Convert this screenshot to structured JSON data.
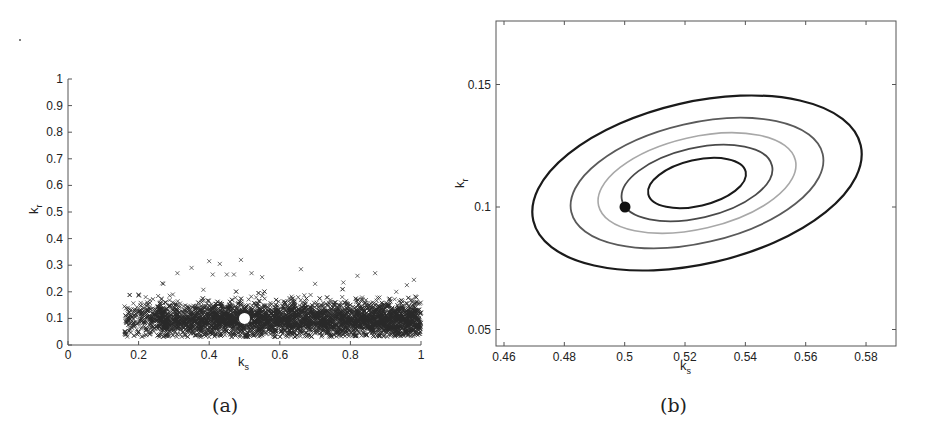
{
  "chart_data": [
    {
      "id": "a",
      "type": "scatter",
      "caption": "(a)",
      "xlabel": "k_s",
      "ylabel": "k_r",
      "xlim": [
        0,
        1
      ],
      "ylim": [
        0,
        1
      ],
      "xticks": [
        "0",
        "0.2",
        "0.4",
        "0.6",
        "0.8",
        "1"
      ],
      "yticks": [
        "0",
        "0.1",
        "0.2",
        "0.3",
        "0.4",
        "0.5",
        "0.6",
        "0.7",
        "0.8",
        "0.9",
        "1"
      ],
      "grid": false,
      "series": [
        {
          "name": "samples",
          "marker": "x",
          "color": "#222222",
          "description": "dense cloud of x-markers spanning k_s from ~0.16 to 1.0, k_r mostly 0.03-0.2, scattered outliers up to ~0.32",
          "x_range": [
            0.16,
            1.0
          ],
          "y_core_range": [
            0.04,
            0.18
          ],
          "y_max_outlier": 0.32
        },
        {
          "name": "true value",
          "marker": "filled-circle",
          "color": "#ffffff",
          "x": [
            0.5
          ],
          "y": [
            0.1
          ]
        }
      ]
    },
    {
      "id": "b",
      "type": "contour",
      "caption": "(b)",
      "xlabel": "k_s",
      "ylabel": "k_r",
      "xlim": [
        0.457,
        0.59
      ],
      "ylim": [
        0.043,
        0.176
      ],
      "xticks": [
        "0.46",
        "0.48",
        "0.5",
        "0.52",
        "0.54",
        "0.56",
        "0.58"
      ],
      "yticks": [
        "0.05",
        "0.1",
        "0.15"
      ],
      "grid": false,
      "contours": [
        {
          "level": 1,
          "color": "#1a1a1a",
          "center": [
            0.525,
            0.11
          ],
          "note": "innermost"
        },
        {
          "level": 2,
          "color": "#4a4a4a",
          "center": [
            0.525,
            0.11
          ]
        },
        {
          "level": 3,
          "color": "#a8a8a8",
          "center": [
            0.525,
            0.11
          ]
        },
        {
          "level": 4,
          "color": "#5a5a5a",
          "center": [
            0.525,
            0.11
          ]
        },
        {
          "level": 5,
          "color": "#1a1a1a",
          "center": [
            0.525,
            0.11
          ],
          "note": "outermost"
        }
      ],
      "series": [
        {
          "name": "true value",
          "marker": "filled-circle",
          "color": "#111111",
          "x": [
            0.5
          ],
          "y": [
            0.1
          ]
        }
      ]
    }
  ]
}
